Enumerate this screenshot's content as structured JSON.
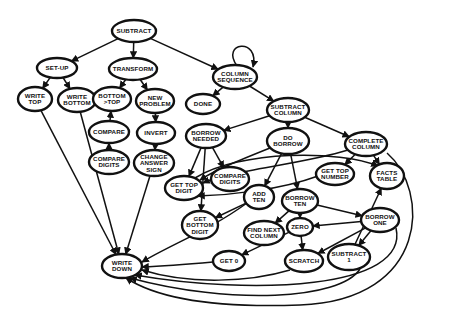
{
  "title": "",
  "colors": {
    "ink": "#111111",
    "background": "#ffffff"
  },
  "nodes": [
    {
      "id": "subtract",
      "lines": [
        "SUBTRACT"
      ]
    },
    {
      "id": "set-up",
      "lines": [
        "SET-UP"
      ]
    },
    {
      "id": "transform",
      "lines": [
        "TRANSFORM"
      ]
    },
    {
      "id": "column-sequence",
      "lines": [
        "COLUMN",
        "SEQUENCE"
      ]
    },
    {
      "id": "write-top",
      "lines": [
        "WRITE",
        "TOP"
      ]
    },
    {
      "id": "write-bottom",
      "lines": [
        "WRITE",
        "BOTTOM"
      ]
    },
    {
      "id": "bottom-gt-top",
      "lines": [
        "BOTTOM",
        ">TOP"
      ]
    },
    {
      "id": "new-problem",
      "lines": [
        "NEW",
        "PROBLEM"
      ]
    },
    {
      "id": "done",
      "lines": [
        "DONE"
      ]
    },
    {
      "id": "subtract-column",
      "lines": [
        "SUBTRACT",
        "COLUMN"
      ]
    },
    {
      "id": "compare",
      "lines": [
        "COMPARE"
      ]
    },
    {
      "id": "invert",
      "lines": [
        "INVERT"
      ]
    },
    {
      "id": "borrow-needed",
      "lines": [
        "BORROW",
        "NEEDED"
      ]
    },
    {
      "id": "do-borrow",
      "lines": [
        "DO",
        "BORROW"
      ]
    },
    {
      "id": "complete-column",
      "lines": [
        "COMPLETE",
        "COLUMN"
      ]
    },
    {
      "id": "compare-digits-1",
      "lines": [
        "COMPARE",
        "DIGITS"
      ]
    },
    {
      "id": "change-answer-sign",
      "lines": [
        "CHANGE",
        "ANSWER",
        "SIGN"
      ]
    },
    {
      "id": "get-top-digit",
      "lines": [
        "GET TOP",
        "DIGIT"
      ]
    },
    {
      "id": "compare-digits-2",
      "lines": [
        "COMPARE",
        "DIGITS"
      ]
    },
    {
      "id": "get-top-number",
      "lines": [
        "GET TOP",
        "NUMBER"
      ]
    },
    {
      "id": "facts-table",
      "lines": [
        "FACTS",
        "TABLE"
      ]
    },
    {
      "id": "add-ten",
      "lines": [
        "ADD",
        "TEN"
      ]
    },
    {
      "id": "borrow-ten",
      "lines": [
        "BORROW",
        "TEN"
      ]
    },
    {
      "id": "get-bottom-digit",
      "lines": [
        "GET",
        "BOTTOM",
        "DIGIT"
      ]
    },
    {
      "id": "find-next-column",
      "lines": [
        "FIND NEXT",
        "COLUMN"
      ]
    },
    {
      "id": "zero",
      "lines": [
        "ZERO"
      ]
    },
    {
      "id": "borrow-one",
      "lines": [
        "BORROW",
        "ONE"
      ]
    },
    {
      "id": "get-0",
      "lines": [
        "GET 0"
      ]
    },
    {
      "id": "scratch",
      "lines": [
        "SCRATCH"
      ]
    },
    {
      "id": "subtract-1",
      "lines": [
        "SUBTRACT",
        "1"
      ]
    },
    {
      "id": "write-down",
      "lines": [
        "WRITE",
        "DOWN"
      ]
    }
  ],
  "edges": [
    {
      "from": "subtract",
      "to": "set-up"
    },
    {
      "from": "subtract",
      "to": "transform"
    },
    {
      "from": "subtract",
      "to": "column-sequence"
    },
    {
      "from": "column-sequence",
      "to": "column-sequence"
    },
    {
      "from": "set-up",
      "to": "write-top"
    },
    {
      "from": "set-up",
      "to": "write-bottom"
    },
    {
      "from": "transform",
      "to": "bottom-gt-top"
    },
    {
      "from": "transform",
      "to": "new-problem"
    },
    {
      "from": "column-sequence",
      "to": "done"
    },
    {
      "from": "column-sequence",
      "to": "subtract-column"
    },
    {
      "from": "compare",
      "to": "bottom-gt-top"
    },
    {
      "from": "new-problem",
      "to": "invert"
    },
    {
      "from": "compare-digits-1",
      "to": "compare"
    },
    {
      "from": "invert",
      "to": "change-answer-sign"
    },
    {
      "from": "subtract-column",
      "to": "borrow-needed"
    },
    {
      "from": "subtract-column",
      "to": "do-borrow"
    },
    {
      "from": "subtract-column",
      "to": "complete-column"
    },
    {
      "from": "borrow-needed",
      "to": "get-top-digit"
    },
    {
      "from": "borrow-needed",
      "to": "compare-digits-2"
    },
    {
      "from": "borrow-needed",
      "to": "get-bottom-digit"
    },
    {
      "from": "do-borrow",
      "to": "add-ten"
    },
    {
      "from": "do-borrow",
      "to": "borrow-ten"
    },
    {
      "from": "do-borrow",
      "to": "get-top-digit"
    },
    {
      "from": "complete-column",
      "to": "get-top-number"
    },
    {
      "from": "complete-column",
      "to": "facts-table"
    },
    {
      "from": "complete-column",
      "to": "get-top-digit"
    },
    {
      "from": "complete-column",
      "to": "write-down"
    },
    {
      "from": "get-top-number",
      "to": "get-top-digit"
    },
    {
      "from": "add-ten",
      "to": "get-bottom-digit"
    },
    {
      "from": "borrow-ten",
      "to": "find-next-column"
    },
    {
      "from": "borrow-ten",
      "to": "zero"
    },
    {
      "from": "borrow-ten",
      "to": "borrow-one"
    },
    {
      "from": "zero",
      "to": "scratch"
    },
    {
      "from": "zero",
      "to": "get-0"
    },
    {
      "from": "borrow-one",
      "to": "zero"
    },
    {
      "from": "borrow-one",
      "to": "scratch"
    },
    {
      "from": "borrow-one",
      "to": "subtract-1"
    },
    {
      "from": "subtract-1",
      "to": "facts-table"
    },
    {
      "from": "write-top",
      "to": "write-down"
    },
    {
      "from": "write-bottom",
      "to": "write-down"
    },
    {
      "from": "change-answer-sign",
      "to": "write-down"
    },
    {
      "from": "get-0",
      "to": "write-down"
    },
    {
      "from": "scratch",
      "to": "write-down"
    },
    {
      "from": "subtract-1",
      "to": "write-down"
    },
    {
      "from": "borrow-one",
      "to": "write-down"
    },
    {
      "from": "add-ten",
      "to": "write-down"
    },
    {
      "from": "get-top-digit",
      "to": "facts-table"
    }
  ]
}
